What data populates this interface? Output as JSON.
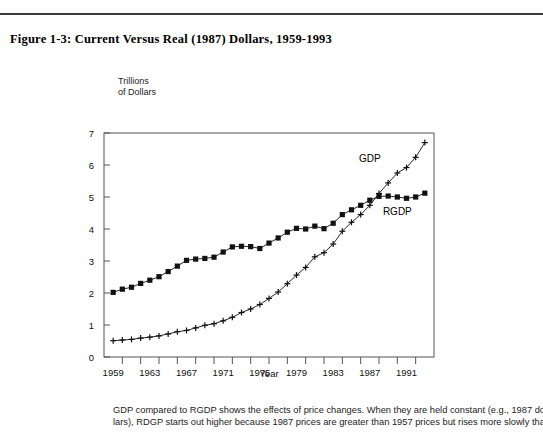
{
  "document": {
    "figure_title": "Figure 1-3: Current Versus Real (1987) Dollars, 1959-1993",
    "caption_line_1": "GDP compared to RGDP shows the effects of price changes. When they are held constant (e.g., 1987 dol-",
    "caption_line_2": "lars), RDGP starts out higher because 1987 prices are greater than 1957 prices but rises more slowly than"
  },
  "chart_data": {
    "type": "line",
    "title": "Figure 1-3: Current Versus Real (1987) Dollars, 1959-1993",
    "xlabel": "Year",
    "ylabel": "Trillions\nof Dollars",
    "ylabel_line_1": "Trillions",
    "ylabel_line_2": "of Dollars",
    "xlim": [
      1958,
      1994
    ],
    "ylim": [
      0,
      7
    ],
    "yticks": [
      0,
      1,
      2,
      3,
      4,
      5,
      6,
      7
    ],
    "ytick_labels": [
      "0",
      "1",
      "2",
      "3",
      "4",
      "5",
      "6",
      "7"
    ],
    "xtick_labels": [
      "1959",
      "1963",
      "1967",
      "1971",
      "1975",
      "1979",
      "1983",
      "1987",
      "1991"
    ],
    "xtick_label_years": [
      1959,
      1963,
      1967,
      1971,
      1975,
      1979,
      1983,
      1987,
      1991
    ],
    "xtick_mark_years": [
      1961,
      1963,
      1965,
      1967,
      1969,
      1971,
      1973,
      1975,
      1977,
      1979,
      1981,
      1983,
      1985,
      1987,
      1989,
      1991,
      1993
    ],
    "grid": false,
    "legend_position": "inline-annotation",
    "x": [
      1959,
      1960,
      1961,
      1962,
      1963,
      1964,
      1965,
      1966,
      1967,
      1968,
      1969,
      1970,
      1971,
      1972,
      1973,
      1974,
      1975,
      1976,
      1977,
      1978,
      1979,
      1980,
      1981,
      1982,
      1983,
      1984,
      1985,
      1986,
      1987,
      1988,
      1989,
      1990,
      1991,
      1992,
      1993
    ],
    "series": [
      {
        "name": "GDP",
        "label": "GDP",
        "marker": "plus",
        "color": "#111111",
        "values": [
          0.51,
          0.53,
          0.55,
          0.59,
          0.62,
          0.66,
          0.72,
          0.79,
          0.83,
          0.91,
          0.99,
          1.04,
          1.13,
          1.24,
          1.39,
          1.5,
          1.64,
          1.83,
          2.03,
          2.29,
          2.56,
          2.8,
          3.13,
          3.26,
          3.53,
          3.93,
          4.21,
          4.45,
          4.74,
          5.11,
          5.44,
          5.75,
          5.92,
          6.24,
          6.7
        ]
      },
      {
        "name": "RGDP",
        "label": "RGDP",
        "marker": "square",
        "color": "#111111",
        "values": [
          2.02,
          2.12,
          2.18,
          2.3,
          2.4,
          2.51,
          2.67,
          2.84,
          3.02,
          3.06,
          3.08,
          3.12,
          3.28,
          3.44,
          3.46,
          3.45,
          3.39,
          3.56,
          3.72,
          3.9,
          4.02,
          4.0,
          4.09,
          4.01,
          4.18,
          4.45,
          4.6,
          4.74,
          4.9,
          5.02,
          5.03,
          5.0,
          4.96,
          5.0,
          5.12
        ]
      }
    ],
    "annotations": [
      {
        "text": "GDP",
        "x": 1987,
        "y": 6.1
      },
      {
        "text": "RGDP",
        "x": 1990,
        "y": 4.45
      }
    ]
  }
}
